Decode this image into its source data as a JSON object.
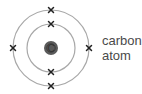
{
  "diagram": {
    "label_lines": [
      "carbon",
      "atom"
    ],
    "nucleus": {
      "symbol": "C",
      "color": "#5a5a5a",
      "cx": 51,
      "cy": 48,
      "r": 7
    },
    "shells": [
      {
        "name": "inner",
        "r": 24,
        "electrons": 2,
        "color": "#a8a8a8"
      },
      {
        "name": "outer",
        "r": 38,
        "electrons": 4,
        "color": "#a8a8a8"
      }
    ],
    "electron_marker": "cross",
    "electron_color": "#222222"
  }
}
